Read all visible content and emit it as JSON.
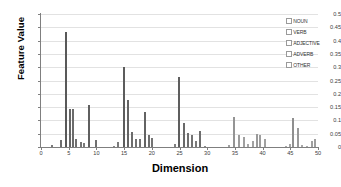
{
  "chart_data": {
    "type": "bar",
    "title": "",
    "xlabel": "Dimension",
    "ylabel": "Feature Value",
    "xlim": [
      0,
      50
    ],
    "ylim": [
      0,
      0.5
    ],
    "grid": true,
    "legend_position": "top-right",
    "x_ticks": [
      0,
      5,
      10,
      15,
      20,
      25,
      30,
      35,
      40,
      45,
      50
    ],
    "y_ticks": [
      0,
      0.05,
      0.1,
      0.15,
      0.2,
      0.25,
      0.3,
      0.35,
      0.4,
      0.45,
      0.5
    ],
    "y_tick_labels": [
      "0",
      "0.05",
      "0.1",
      "0.15",
      "0.2",
      "0.25",
      "0.3",
      "0.35",
      "0.4",
      "0.45",
      "0.5"
    ],
    "x_tick_labels": [
      "0",
      "5",
      "10",
      "15",
      "20",
      "25",
      "30",
      "35",
      "40",
      "45",
      "50"
    ],
    "legend": [
      {
        "label": "NOUN",
        "color": "#595959"
      },
      {
        "label": "VERB",
        "color": "#7f7f7f"
      },
      {
        "label": "ADJECTIVE",
        "color": "#a6a6a6"
      },
      {
        "label": "ADVERB",
        "color": "#bfbfbf"
      },
      {
        "label": "OTHER",
        "color": "#d9d9d9"
      }
    ],
    "points": [
      {
        "x": 2,
        "y": 0.008,
        "color": "#7a7a7a"
      },
      {
        "x": 3.6,
        "y": 0.028,
        "color": "#6e6e6e"
      },
      {
        "x": 4.6,
        "y": 0.432,
        "color": "#595959"
      },
      {
        "x": 5.2,
        "y": 0.143,
        "color": "#666666"
      },
      {
        "x": 5.8,
        "y": 0.142,
        "color": "#6b6b6b"
      },
      {
        "x": 6.4,
        "y": 0.03,
        "color": "#707070"
      },
      {
        "x": 7.2,
        "y": 0.019,
        "color": "#757575"
      },
      {
        "x": 7.7,
        "y": 0.014,
        "color": "#787878"
      },
      {
        "x": 8.7,
        "y": 0.157,
        "color": "#5f5f5f"
      },
      {
        "x": 9.9,
        "y": 0.028,
        "color": "#6f6f6f"
      },
      {
        "x": 13.2,
        "y": 0.004,
        "color": "#8a8a8a"
      },
      {
        "x": 13.9,
        "y": 0.018,
        "color": "#7b7b7b"
      },
      {
        "x": 14.9,
        "y": 0.301,
        "color": "#5c5c5c"
      },
      {
        "x": 15.7,
        "y": 0.177,
        "color": "#646464"
      },
      {
        "x": 16.4,
        "y": 0.057,
        "color": "#6c6c6c"
      },
      {
        "x": 17.1,
        "y": 0.032,
        "color": "#727272"
      },
      {
        "x": 17.8,
        "y": 0.032,
        "color": "#727272"
      },
      {
        "x": 18.7,
        "y": 0.132,
        "color": "#636363"
      },
      {
        "x": 19.5,
        "y": 0.045,
        "color": "#6e6e6e"
      },
      {
        "x": 20.1,
        "y": 0.035,
        "color": "#747474"
      },
      {
        "x": 24.1,
        "y": 0.013,
        "color": "#808080"
      },
      {
        "x": 24.9,
        "y": 0.262,
        "color": "#5e5e5e"
      },
      {
        "x": 25.9,
        "y": 0.089,
        "color": "#696969"
      },
      {
        "x": 26.5,
        "y": 0.053,
        "color": "#6f6f6f"
      },
      {
        "x": 27.2,
        "y": 0.046,
        "color": "#737373"
      },
      {
        "x": 27.9,
        "y": 0.022,
        "color": "#7a7a7a"
      },
      {
        "x": 28.7,
        "y": 0.059,
        "color": "#6d6d6d"
      },
      {
        "x": 29.6,
        "y": 0.004,
        "color": "#8c8c8c"
      },
      {
        "x": 33.9,
        "y": 0.007,
        "color": "#a0a0a0"
      },
      {
        "x": 34.9,
        "y": 0.113,
        "color": "#949494"
      },
      {
        "x": 35.8,
        "y": 0.044,
        "color": "#9c9c9c"
      },
      {
        "x": 36.6,
        "y": 0.038,
        "color": "#a0a0a0"
      },
      {
        "x": 37.4,
        "y": 0.011,
        "color": "#a8a8a8"
      },
      {
        "x": 38.3,
        "y": 0.022,
        "color": "#a2a2a2"
      },
      {
        "x": 38.9,
        "y": 0.05,
        "color": "#9a9a9a"
      },
      {
        "x": 39.6,
        "y": 0.047,
        "color": "#9d9d9d"
      },
      {
        "x": 40.4,
        "y": 0.032,
        "color": "#a1a1a1"
      },
      {
        "x": 44.2,
        "y": 0.005,
        "color": "#a9a9a9"
      },
      {
        "x": 44.9,
        "y": 0.01,
        "color": "#a5a5a5"
      },
      {
        "x": 45.5,
        "y": 0.11,
        "color": "#8f8f8f"
      },
      {
        "x": 46.3,
        "y": 0.07,
        "color": "#999999"
      },
      {
        "x": 47.1,
        "y": 0.006,
        "color": "#a8a8a8"
      },
      {
        "x": 48.0,
        "y": 0.005,
        "color": "#ababab"
      },
      {
        "x": 48.9,
        "y": 0.022,
        "color": "#a0a0a0"
      },
      {
        "x": 49.4,
        "y": 0.03,
        "color": "#9e9e9e"
      }
    ]
  }
}
